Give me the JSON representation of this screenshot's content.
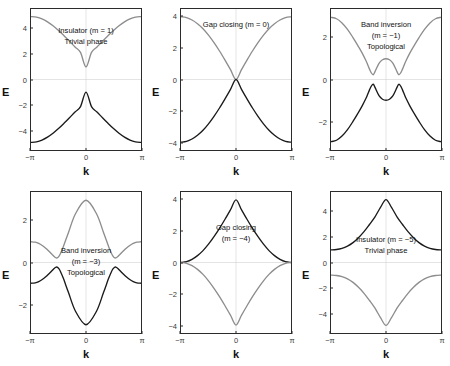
{
  "figure": {
    "axis_labels": {
      "x": "k",
      "y": "E"
    },
    "xticks": [
      "−π",
      "0",
      "π"
    ],
    "colors": {
      "valence_band": "#1a1a1a",
      "conduction_band": "#8d8d8d",
      "axis": "#2b2b2b",
      "zero_line": "#c9c9c9",
      "background": "#ffffff"
    }
  },
  "chart_data": [
    {
      "type": "line",
      "title": "Insulator (m = 1) — Trivial phase",
      "annotation": [
        "Insulator (m = 1)",
        "Trivial phase"
      ],
      "annotation_top_pct": 12,
      "xlabel": "k",
      "ylabel": "E",
      "xlim": [
        -3.14159,
        3.14159
      ],
      "ylim": [
        -5.6,
        5.6
      ],
      "yticks": [
        4,
        2,
        0,
        -2,
        -4
      ],
      "ytick_labels": [
        "4",
        "2",
        "0",
        "−2",
        "−4"
      ],
      "grid": false,
      "m": 1,
      "series": [
        {
          "name": "conduction band",
          "color": "#8d8d8d",
          "x": [
            -3.14159,
            -2.82743,
            -2.51327,
            -2.19911,
            -1.88496,
            -1.5708,
            -1.25664,
            -0.94248,
            -0.62832,
            -0.31416,
            0,
            0.31416,
            0.62832,
            0.94248,
            1.25664,
            1.5708,
            1.88496,
            2.19911,
            2.51327,
            2.82743,
            3.14159
          ],
          "y": [
            5.0,
            4.95,
            4.81,
            4.58,
            4.27,
            3.9,
            3.48,
            3.04,
            2.58,
            2.15,
            1.0,
            2.15,
            2.58,
            3.04,
            3.48,
            3.9,
            4.27,
            4.58,
            4.81,
            4.95,
            5.0
          ]
        },
        {
          "name": "valence band",
          "color": "#1a1a1a",
          "x": [
            -3.14159,
            -2.82743,
            -2.51327,
            -2.19911,
            -1.88496,
            -1.5708,
            -1.25664,
            -0.94248,
            -0.62832,
            -0.31416,
            0,
            0.31416,
            0.62832,
            0.94248,
            1.25664,
            1.5708,
            1.88496,
            2.19911,
            2.51327,
            2.82743,
            3.14159
          ],
          "y": [
            -5.0,
            -4.95,
            -4.81,
            -4.58,
            -4.27,
            -3.9,
            -3.48,
            -3.04,
            -2.58,
            -2.15,
            -1.0,
            -2.15,
            -2.58,
            -3.04,
            -3.48,
            -3.9,
            -4.27,
            -4.58,
            -4.81,
            -4.95,
            -5.0
          ]
        }
      ]
    },
    {
      "type": "line",
      "title": "Gap closing (m = 0)",
      "annotation": [
        "Gap closing (m = 0)"
      ],
      "annotation_top_pct": 8,
      "xlabel": "k",
      "ylabel": "E",
      "xlim": [
        -3.14159,
        3.14159
      ],
      "ylim": [
        -4.5,
        4.5
      ],
      "yticks": [
        4,
        2,
        0,
        -2,
        -4
      ],
      "ytick_labels": [
        "4",
        "2",
        "0",
        "−2",
        "−4"
      ],
      "grid": false,
      "m": 0,
      "series": [
        {
          "name": "conduction band",
          "color": "#8d8d8d",
          "x": [
            -3.14159,
            -2.82743,
            -2.51327,
            -2.19911,
            -1.88496,
            -1.5708,
            -1.25664,
            -0.94248,
            -0.62832,
            -0.31416,
            0,
            0.31416,
            0.62832,
            0.94248,
            1.25664,
            1.5708,
            1.88496,
            2.19911,
            2.51327,
            2.82743,
            3.14159
          ],
          "y": [
            4.0,
            3.95,
            3.8,
            3.56,
            3.24,
            2.83,
            2.35,
            1.82,
            1.24,
            0.63,
            0.0,
            0.63,
            1.24,
            1.82,
            2.35,
            2.83,
            3.24,
            3.56,
            3.8,
            3.95,
            4.0
          ]
        },
        {
          "name": "valence band",
          "color": "#1a1a1a",
          "x": [
            -3.14159,
            -2.82743,
            -2.51327,
            -2.19911,
            -1.88496,
            -1.5708,
            -1.25664,
            -0.94248,
            -0.62832,
            -0.31416,
            0,
            0.31416,
            0.62832,
            0.94248,
            1.25664,
            1.5708,
            1.88496,
            2.19911,
            2.51327,
            2.82743,
            3.14159
          ],
          "y": [
            -4.0,
            -3.95,
            -3.8,
            -3.56,
            -3.24,
            -2.83,
            -2.35,
            -1.82,
            -1.24,
            -0.63,
            0.0,
            -0.63,
            -1.24,
            -1.82,
            -2.35,
            -2.83,
            -3.24,
            -3.56,
            -3.8,
            -3.95,
            -4.0
          ]
        }
      ]
    },
    {
      "type": "line",
      "title": "Band inversion (m = −1) — Topological",
      "annotation": [
        "Band inversion",
        "(m = −1)",
        "Topological"
      ],
      "annotation_top_pct": 8,
      "xlabel": "k",
      "ylabel": "E",
      "xlim": [
        -3.14159,
        3.14159
      ],
      "ylim": [
        -3.4,
        3.4
      ],
      "yticks": [
        2,
        0,
        -2
      ],
      "ytick_labels": [
        "2",
        "0",
        "−2"
      ],
      "grid": false,
      "m": -1,
      "series": [
        {
          "name": "conduction band",
          "color": "#8d8d8d",
          "x": [
            -3.14159,
            -2.82743,
            -2.51327,
            -2.19911,
            -1.88496,
            -1.5708,
            -1.36,
            -1.15,
            -1.05,
            -0.94248,
            -0.84,
            -0.73,
            -0.62832,
            -0.4,
            -0.2,
            0,
            0.2,
            0.4,
            0.62832,
            0.73,
            0.84,
            0.94248,
            1.05,
            1.15,
            1.36,
            1.5708,
            1.88496,
            2.19911,
            2.51327,
            2.82743,
            3.14159
          ],
          "y": [
            3.0,
            2.93,
            2.73,
            2.42,
            2.02,
            1.58,
            1.27,
            0.92,
            0.72,
            0.5,
            0.32,
            0.23,
            0.38,
            0.78,
            0.95,
            1.0,
            0.95,
            0.78,
            0.38,
            0.23,
            0.32,
            0.5,
            0.72,
            0.92,
            1.27,
            1.58,
            2.02,
            2.42,
            2.73,
            2.93,
            3.0
          ]
        },
        {
          "name": "valence band",
          "color": "#1a1a1a",
          "x": [
            -3.14159,
            -2.82743,
            -2.51327,
            -2.19911,
            -1.88496,
            -1.5708,
            -1.36,
            -1.15,
            -1.05,
            -0.94248,
            -0.84,
            -0.73,
            -0.62832,
            -0.4,
            -0.2,
            0,
            0.2,
            0.4,
            0.62832,
            0.73,
            0.84,
            0.94248,
            1.05,
            1.15,
            1.36,
            1.5708,
            1.88496,
            2.19911,
            2.51327,
            2.82743,
            3.14159
          ],
          "y": [
            -3.0,
            -2.93,
            -2.73,
            -2.42,
            -2.02,
            -1.58,
            -1.27,
            -0.92,
            -0.72,
            -0.5,
            -0.32,
            -0.23,
            -0.38,
            -0.78,
            -0.95,
            -1.0,
            -0.95,
            -0.78,
            -0.38,
            -0.23,
            -0.32,
            -0.5,
            -0.72,
            -0.92,
            -1.27,
            -1.58,
            -2.02,
            -2.42,
            -2.73,
            -2.93,
            -3.0
          ]
        }
      ]
    },
    {
      "type": "line",
      "title": "Band inversion (m = −3) — Topological",
      "annotation": [
        "Band inversion",
        "(m = −3)",
        "Topological"
      ],
      "annotation_top_pct": 38,
      "xlabel": "k",
      "ylabel": "E",
      "xlim": [
        -3.14159,
        3.14159
      ],
      "ylim": [
        -3.4,
        3.4
      ],
      "yticks": [
        2,
        0,
        -2
      ],
      "ytick_labels": [
        "2",
        "0",
        "−2"
      ],
      "grid": false,
      "m": -3,
      "series": [
        {
          "name": "conduction band",
          "color": "#8d8d8d",
          "x": [
            -3.14159,
            -2.9,
            -2.7,
            -2.5,
            -2.3,
            -2.1,
            -1.95,
            -1.85,
            -1.75,
            -1.65,
            -1.55,
            -1.45,
            -1.3,
            -1.0,
            -0.6,
            0,
            0.6,
            1.0,
            1.3,
            1.45,
            1.55,
            1.65,
            1.75,
            1.85,
            1.95,
            2.1,
            2.3,
            2.5,
            2.7,
            2.9,
            3.14159
          ],
          "y": [
            1.0,
            0.98,
            0.92,
            0.82,
            0.69,
            0.53,
            0.4,
            0.31,
            0.24,
            0.22,
            0.3,
            0.45,
            0.75,
            1.45,
            2.35,
            3.0,
            2.35,
            1.45,
            0.75,
            0.45,
            0.3,
            0.22,
            0.24,
            0.31,
            0.4,
            0.53,
            0.69,
            0.82,
            0.92,
            0.98,
            1.0
          ]
        },
        {
          "name": "valence band",
          "color": "#1a1a1a",
          "x": [
            -3.14159,
            -2.9,
            -2.7,
            -2.5,
            -2.3,
            -2.1,
            -1.95,
            -1.85,
            -1.75,
            -1.65,
            -1.55,
            -1.45,
            -1.3,
            -1.0,
            -0.6,
            0,
            0.6,
            1.0,
            1.3,
            1.45,
            1.55,
            1.65,
            1.75,
            1.85,
            1.95,
            2.1,
            2.3,
            2.5,
            2.7,
            2.9,
            3.14159
          ],
          "y": [
            -1.0,
            -0.98,
            -0.92,
            -0.82,
            -0.69,
            -0.53,
            -0.4,
            -0.31,
            -0.24,
            -0.22,
            -0.3,
            -0.45,
            -0.75,
            -1.45,
            -2.35,
            -3.0,
            -2.35,
            -1.45,
            -0.75,
            -0.45,
            -0.3,
            -0.22,
            -0.24,
            -0.31,
            -0.4,
            -0.53,
            -0.69,
            -0.82,
            -0.92,
            -0.98,
            -1.0
          ]
        }
      ]
    },
    {
      "type": "line",
      "title": "Gap closing (m = −4)",
      "annotation": [
        "Gap closing",
        "(m = −4)"
      ],
      "annotation_top_pct": 22,
      "xlabel": "k",
      "ylabel": "E",
      "xlim": [
        -3.14159,
        3.14159
      ],
      "ylim": [
        -4.5,
        4.5
      ],
      "yticks": [
        4,
        2,
        0,
        -2,
        -4
      ],
      "ytick_labels": [
        "4",
        "2",
        "0",
        "−2",
        "−4"
      ],
      "grid": false,
      "m": -4,
      "series": [
        {
          "name": "valence band",
          "color": "#1a1a1a",
          "x": [
            -3.14159,
            -2.82743,
            -2.51327,
            -2.19911,
            -1.88496,
            -1.5708,
            -1.25664,
            -0.94248,
            -0.62832,
            -0.31416,
            0,
            0.31416,
            0.62832,
            0.94248,
            1.25664,
            1.5708,
            1.88496,
            2.19911,
            2.51327,
            2.82743,
            3.14159
          ],
          "y": [
            0.0,
            0.05,
            0.2,
            0.44,
            0.76,
            1.17,
            1.65,
            2.18,
            2.76,
            3.37,
            4.0,
            3.37,
            2.76,
            2.18,
            1.65,
            1.17,
            0.76,
            0.44,
            0.2,
            0.05,
            0.0
          ]
        },
        {
          "name": "conduction band",
          "color": "#8d8d8d",
          "x": [
            -3.14159,
            -2.82743,
            -2.51327,
            -2.19911,
            -1.88496,
            -1.5708,
            -1.25664,
            -0.94248,
            -0.62832,
            -0.31416,
            0,
            0.31416,
            0.62832,
            0.94248,
            1.25664,
            1.5708,
            1.88496,
            2.19911,
            2.51327,
            2.82743,
            3.14159
          ],
          "y": [
            0.0,
            -0.05,
            -0.2,
            -0.44,
            -0.76,
            -1.17,
            -1.65,
            -2.18,
            -2.76,
            -3.37,
            -4.0,
            -3.37,
            -2.76,
            -2.18,
            -1.65,
            -1.17,
            -0.76,
            -0.44,
            -0.2,
            -0.05,
            0.0
          ]
        }
      ]
    },
    {
      "type": "line",
      "title": "Insulator (m = −5) — Trivial phase",
      "annotation": [
        "Insulator (m = −5)",
        "Trivial phase"
      ],
      "annotation_top_pct": 30,
      "xlabel": "k",
      "ylabel": "E",
      "xlim": [
        -3.14159,
        3.14159
      ],
      "ylim": [
        -5.6,
        5.6
      ],
      "yticks": [
        4,
        2,
        0,
        -2,
        -4
      ],
      "ytick_labels": [
        "4",
        "2",
        "0",
        "−2",
        "−4"
      ],
      "grid": false,
      "m": -5,
      "series": [
        {
          "name": "valence band",
          "color": "#1a1a1a",
          "x": [
            -3.14159,
            -2.82743,
            -2.51327,
            -2.19911,
            -1.88496,
            -1.5708,
            -1.25664,
            -0.94248,
            -0.62832,
            -0.31416,
            0,
            0.31416,
            0.62832,
            0.94248,
            1.25664,
            1.5708,
            1.88496,
            2.19911,
            2.51327,
            2.82743,
            3.14159
          ],
          "y": [
            1.0,
            1.03,
            1.12,
            1.3,
            1.58,
            1.97,
            2.45,
            3.02,
            3.63,
            4.38,
            5.0,
            4.38,
            3.63,
            3.02,
            2.45,
            1.97,
            1.58,
            1.3,
            1.12,
            1.03,
            1.0
          ]
        },
        {
          "name": "conduction band",
          "color": "#8d8d8d",
          "x": [
            -3.14159,
            -2.82743,
            -2.51327,
            -2.19911,
            -1.88496,
            -1.5708,
            -1.25664,
            -0.94248,
            -0.62832,
            -0.31416,
            0,
            0.31416,
            0.62832,
            0.94248,
            1.25664,
            1.5708,
            1.88496,
            2.19911,
            2.51327,
            2.82743,
            3.14159
          ],
          "y": [
            -1.0,
            -1.03,
            -1.12,
            -1.3,
            -1.58,
            -1.97,
            -2.45,
            -3.02,
            -3.63,
            -4.38,
            -5.0,
            -4.38,
            -3.63,
            -3.02,
            -2.45,
            -1.97,
            -1.58,
            -1.3,
            -1.12,
            -1.03,
            -1.0
          ]
        }
      ]
    }
  ]
}
